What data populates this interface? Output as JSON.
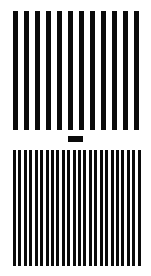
{
  "figure": {
    "top_grating": {
      "bar_count": 12,
      "bar_color": "#0a0a0a",
      "background_color": "#ffffff",
      "frequency": "low"
    },
    "separator": {
      "shape": "rectangle",
      "color": "#0a0a0a"
    },
    "bottom_grating": {
      "bar_count": 24,
      "bar_color": "#0a0a0a",
      "background_color": "#ffffff",
      "frequency": "high"
    }
  }
}
